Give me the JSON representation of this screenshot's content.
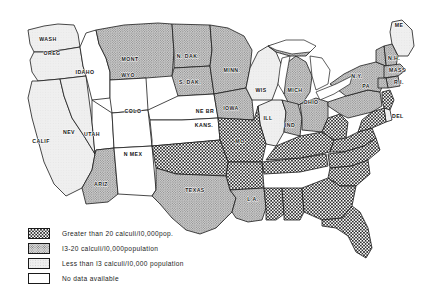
{
  "figure": {
    "type": "choropleth-map"
  },
  "legend": {
    "items": [
      {
        "swatch": "checkerboard-swatch",
        "pattern": "checker",
        "label": "Greater than 20 calculi/I0,000pop."
      },
      {
        "swatch": "gray-stipple-swatch",
        "pattern": "stipple",
        "label": "I3-20 calculi/I0,000population"
      },
      {
        "swatch": "light-gray-swatch",
        "pattern": "light",
        "label": "Less than I3 calculi/I0,000 population"
      },
      {
        "swatch": "white-swatch",
        "pattern": "none",
        "label": "No data available"
      }
    ]
  },
  "colors": {
    "checker_dark": "#2b2b2b",
    "stipple_gray": "#a9a9a9",
    "light_gray": "#e2e2e2",
    "no_data_white": "#ffffff",
    "outline": "#1a1a1a"
  },
  "map_data": {
    "type": "choropleth",
    "categories": [
      "checker",
      "stipple",
      "light",
      "none"
    ],
    "category_meaning": {
      "checker": "Greater than 20 calculi per 10,000 population",
      "stipple": "13-20 calculi per 10,000 population",
      "light": "Less than 13 calculi per 10,000 population",
      "none": "No data available"
    },
    "states": [
      {
        "id": "WASH",
        "label": "WASH",
        "class": "light",
        "lx": 48,
        "ly": 41
      },
      {
        "id": "OREG",
        "label": "OREG",
        "class": "light",
        "lx": 52,
        "ly": 55
      },
      {
        "id": "CALIF",
        "label": "CALIF",
        "class": "light",
        "lx": 41,
        "ly": 143
      },
      {
        "id": "NEV",
        "label": "NEV",
        "class": "light",
        "lx": 69,
        "ly": 134
      },
      {
        "id": "IDAHO",
        "label": "IDAHO",
        "class": "none",
        "lx": 85,
        "ly": 74
      },
      {
        "id": "MONT",
        "label": "MONT",
        "class": "stipple",
        "lx": 130,
        "ly": 61
      },
      {
        "id": "WYO",
        "label": "WYO",
        "class": "none",
        "lx": 128,
        "ly": 77
      },
      {
        "id": "UTAH",
        "label": "UTAH",
        "class": "none",
        "lx": 92,
        "ly": 136
      },
      {
        "id": "COLO",
        "label": "COLO",
        "class": "none",
        "lx": 133,
        "ly": 113
      },
      {
        "id": "ARIZ",
        "label": "ARIZ",
        "class": "stipple",
        "lx": 101,
        "ly": 186
      },
      {
        "id": "NMEX",
        "label": "N MEX",
        "class": "none",
        "lx": 133,
        "ly": 156
      },
      {
        "id": "NDAK",
        "label": "N. DAK.",
        "class": "stipple",
        "lx": 188,
        "ly": 58
      },
      {
        "id": "SDAK",
        "label": "S. DAK.",
        "class": "stipple",
        "lx": 190,
        "ly": 84
      },
      {
        "id": "NEBR",
        "label": "NE BR",
        "class": "none",
        "lx": 205,
        "ly": 113
      },
      {
        "id": "KANS",
        "label": "KANS.",
        "class": "none",
        "lx": 204,
        "ly": 127
      },
      {
        "id": "MINN",
        "label": "MINN.",
        "class": "stipple",
        "lx": 232,
        "ly": 72
      },
      {
        "id": "IOWA",
        "label": "IOWA",
        "class": "stipple",
        "lx": 231,
        "ly": 110
      },
      {
        "id": "WIS",
        "label": "WIS",
        "class": "light",
        "lx": 261,
        "ly": 92
      },
      {
        "id": "MICH",
        "label": "MICH",
        "class": "stipple",
        "lx": 295,
        "ly": 92
      },
      {
        "id": "OHIO",
        "label": "OHIO",
        "class": "stipple",
        "lx": 311,
        "ly": 104
      },
      {
        "id": "IND",
        "label": "IND",
        "class": "stipple",
        "lx": 290,
        "ly": 127
      },
      {
        "id": "ILL",
        "label": "ILL",
        "class": "light",
        "lx": 268,
        "ly": 120
      },
      {
        "id": "MO",
        "label": "MO",
        "class": "checker",
        "lx": 240,
        "ly": 143
      },
      {
        "id": "LA",
        "label": "L A.",
        "class": "stipple",
        "lx": 253,
        "ly": 201
      },
      {
        "id": "TEXAS",
        "label": "TEXAS",
        "class": "stipple",
        "lx": 195,
        "ly": 192
      },
      {
        "id": "NY",
        "label": "N.Y.",
        "class": "stipple",
        "lx": 357,
        "ly": 78
      },
      {
        "id": "PA",
        "label": "PA",
        "class": "stipple",
        "lx": 366,
        "ly": 88
      },
      {
        "id": "ME",
        "label": "ME",
        "class": "light",
        "lx": 399,
        "ly": 27
      },
      {
        "id": "NH",
        "label": "N.H.",
        "class": "stipple",
        "lx": 386,
        "ly": 62
      },
      {
        "id": "MASS",
        "label": "MASS",
        "class": "stipple",
        "lx": 389,
        "ly": 73
      },
      {
        "id": "RI",
        "label": "R.I.",
        "class": "stipple",
        "lx": 396,
        "ly": 84
      },
      {
        "id": "DEL",
        "label": "DEL",
        "class": "light",
        "lx": 393,
        "ly": 118
      }
    ]
  }
}
